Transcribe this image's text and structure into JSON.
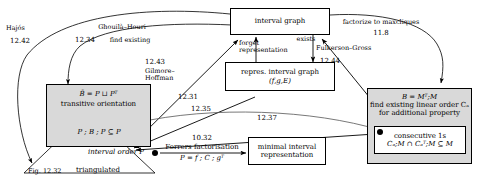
{
  "figure": {
    "type": "concept-map",
    "width": 478,
    "height": 186,
    "background": "#ffffff",
    "shaded_fill": "#d9d9d9",
    "stroke": "#000000"
  },
  "nodes": {
    "interval_graph": {
      "label": "interval graph"
    },
    "repres_interval_graph": {
      "line1": "repres. interval graph",
      "line2": "(f,g,E)"
    },
    "transitive_orientation": {
      "line1": "B̄ = P ⊔ Pᵀ",
      "line2": "transitive orientation"
    },
    "minimal_interval_representation": {
      "line1": "minimal interval",
      "line2": "representation"
    },
    "matrix_box": {
      "line1": "B = Mᵀ;M",
      "line2": "find existing linear order Cₐ",
      "line3": "for additional property"
    },
    "consecutive_ones": {
      "line1": "consecutive 1s",
      "line2": "Cₐ;M ∩ Cₐᵀ;M ⊆ M"
    },
    "interval_order": {
      "label": "interval order P"
    },
    "triangulated": {
      "label": "triangulated"
    },
    "pbp": {
      "label": "P ; B ; P ⊆ P"
    },
    "fig_ref": {
      "label": "Fig. 12.32"
    }
  },
  "edge_labels": {
    "hajos": {
      "name": "Hajós",
      "number": "12.42"
    },
    "ghouila_houri": {
      "name": "Ghouilà–Houri",
      "number": "12.34",
      "extra": "find existing"
    },
    "gilmore_hoffman": {
      "number": "12.43",
      "name_line1": "Gilmore–",
      "name_line2": "Hoffman"
    },
    "forget_representation": {
      "line1": "forget",
      "line2": "representation"
    },
    "exists": {
      "label": "exists"
    },
    "fulkerson_gross": {
      "name": "Fulkerson–Gross",
      "number": "12.44"
    },
    "factorize_maxcliques": {
      "name": "factorize to maxcliques",
      "number": "11.8"
    },
    "e1231": {
      "number": "12.31"
    },
    "e1235": {
      "number": "12.35"
    },
    "e1237": {
      "number": "12.37"
    },
    "ferrers": {
      "number": "10.32",
      "name": "Ferrers factorisation",
      "formula": "P = f ; C ; gᵀ"
    }
  }
}
